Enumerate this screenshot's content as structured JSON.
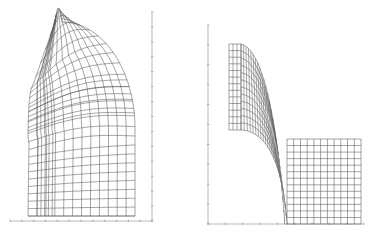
{
  "figure": {
    "panels": [
      {
        "id": "left",
        "description": "Curved structured mesh (quarter-annulus style) with refined band",
        "axes": {
          "x_axis": {
            "x1": 10,
            "x2": 152,
            "y": 221,
            "ticks": 12
          },
          "y_axis": {
            "x": 152,
            "y1": 12,
            "y2": 221,
            "ticks": 14
          }
        },
        "mesh": {
          "center": [
            160,
            148
          ],
          "inner_radius_deg_range": [
            110,
            200
          ],
          "radial_lines": 12,
          "arc_lines": 20,
          "bottom_y": 216,
          "left_x": 28,
          "right_x": 135
        }
      },
      {
        "id": "right",
        "description": "Block-structured mesh: vertical strip, curved transition band, square block",
        "axes": {
          "x_axis": {
            "x1": 208,
            "x2": 364,
            "y": 224,
            "ticks": 9
          },
          "y_axis": {
            "x": 208,
            "y1": 25,
            "y2": 224,
            "ticks": 10
          }
        },
        "strip": {
          "x": 229,
          "y": 44,
          "w": 12,
          "h": 86,
          "cols": 3,
          "rows": 13
        },
        "block": {
          "x": 287,
          "y": 139,
          "w": 74,
          "h": 85,
          "cols": 11,
          "rows": 13
        },
        "band": {
          "lines": 12,
          "rows": 24
        }
      }
    ],
    "caption": ""
  },
  "colors": {
    "line": "#5a5a5a",
    "axis": "#8a8a8a",
    "background": "#ffffff"
  }
}
